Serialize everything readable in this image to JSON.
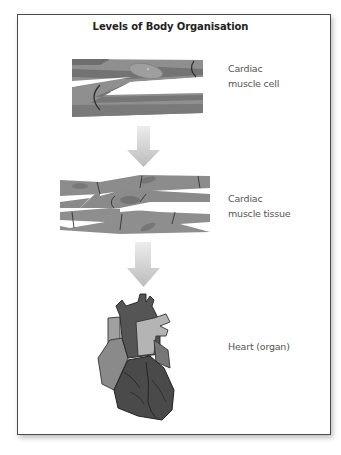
{
  "diagram": {
    "title": "Levels of Body Organisation",
    "levels": [
      {
        "label_lines": [
          "Cardiac",
          "muscle cell"
        ],
        "illustration": "cardiac-muscle-cell"
      },
      {
        "label_lines": [
          "Cardiac",
          "muscle tissue"
        ],
        "illustration": "cardiac-muscle-tissue"
      },
      {
        "label_lines": [
          "Heart (organ)"
        ],
        "illustration": "heart-organ"
      }
    ],
    "arrows": [
      "down-arrow",
      "down-arrow"
    ],
    "colors": {
      "frame": "#4a4a4a",
      "muscle_light": "#8f8f8f",
      "muscle_dark": "#6e6e6e",
      "heart_dark": "#444444",
      "heart_mid": "#6a6a6a",
      "heart_light": "#a8a8a8",
      "arrow": "#c8c8c8",
      "text": "#555555"
    }
  }
}
